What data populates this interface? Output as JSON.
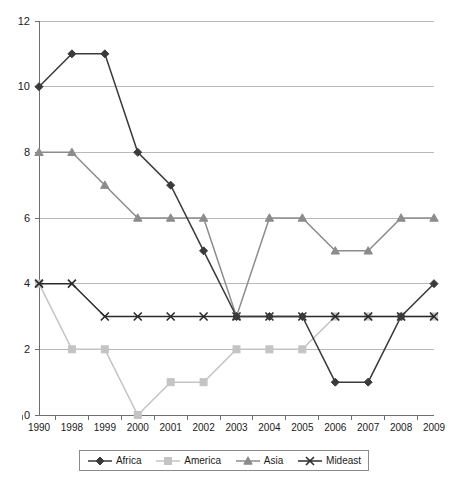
{
  "chart_data": {
    "type": "line",
    "title": "",
    "xlabel": "",
    "ylabel": "",
    "ylim": [
      0,
      12
    ],
    "ytick_step": 2,
    "grid": true,
    "legend_position": "bottom",
    "categories": [
      "1990",
      "1998",
      "1999",
      "2000",
      "2001",
      "2002",
      "2003",
      "2004",
      "2005",
      "2006",
      "2007",
      "2008",
      "2009"
    ],
    "yticks": [
      "0",
      "2",
      "4",
      "6",
      "8",
      "10",
      "12"
    ],
    "series": [
      {
        "name": "Africa",
        "marker": "diamond",
        "color": "#3a3a3a",
        "values": [
          10,
          11,
          11,
          8,
          7,
          5,
          3,
          3,
          3,
          1,
          1,
          3,
          4
        ]
      },
      {
        "name": "America",
        "marker": "square",
        "color": "#c4c4c4",
        "values": [
          4,
          2,
          2,
          0,
          1,
          1,
          2,
          2,
          2,
          3,
          3,
          3,
          3
        ]
      },
      {
        "name": "Asia",
        "marker": "triangle",
        "color": "#8c8c8c",
        "values": [
          8,
          8,
          7,
          6,
          6,
          6,
          3,
          6,
          6,
          5,
          5,
          6,
          6
        ]
      },
      {
        "name": "Mideast",
        "marker": "x",
        "color": "#2b2b2b",
        "values": [
          4,
          4,
          3,
          3,
          3,
          3,
          3,
          3,
          3,
          3,
          3,
          3,
          3
        ]
      }
    ]
  },
  "legend": {
    "items": [
      {
        "label": "Africa"
      },
      {
        "label": "America"
      },
      {
        "label": "Asia"
      },
      {
        "label": "Mideast"
      }
    ]
  },
  "colors": {
    "axis": "#6e6e6e",
    "grid": "#b9b9b9",
    "background": "#ffffff",
    "text": "#1a1a1a"
  }
}
